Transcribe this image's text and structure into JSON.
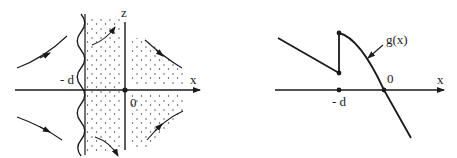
{
  "left_panel": {
    "labels": {
      "z_axis": "z",
      "x_axis": "x",
      "neg_d": "- d",
      "origin": "0"
    },
    "colors": {
      "ink": "#1a1a1a",
      "background": "#ffffff"
    },
    "flow_arrows": [
      {
        "id": "upper-left",
        "direction": "toward-boundary"
      },
      {
        "id": "lower-left",
        "direction": "away-from-boundary"
      },
      {
        "id": "upper-middle",
        "direction": "up-right"
      },
      {
        "id": "lower-middle",
        "direction": "down-right"
      },
      {
        "id": "upper-right",
        "direction": "down-right"
      },
      {
        "id": "lower-right",
        "direction": "up-right"
      }
    ]
  },
  "right_panel": {
    "labels": {
      "function": "g(x)",
      "x_axis": "x",
      "neg_d": "- d",
      "origin": "0"
    }
  }
}
